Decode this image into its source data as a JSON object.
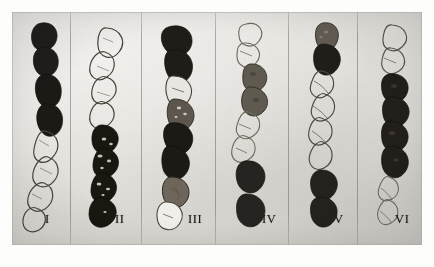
{
  "figure": {
    "kind": "microscope-photographic-plate",
    "caption_labels": [
      "I",
      "II",
      "III",
      "IV",
      "V",
      "VI"
    ],
    "background_color": "#e5e3de",
    "dark_segment_color": "#1e1c1a",
    "mid_segment_color": "#6a645c",
    "light_segment_color": "#efeeea",
    "outline_color": "#3a3732",
    "divider_color": "#76746e",
    "plate_border_color": "#ffffff"
  },
  "panels": [
    {
      "id": "panel-1",
      "label": "I",
      "label_left": 45,
      "label_top": 212,
      "divider_x": 70,
      "description": "chain with four dark stained segments at top and four pale outlined segments below",
      "segments": [
        {
          "tone": "dark"
        },
        {
          "tone": "dark"
        },
        {
          "tone": "dark"
        },
        {
          "tone": "dark"
        },
        {
          "tone": "light"
        },
        {
          "tone": "light"
        },
        {
          "tone": "light"
        },
        {
          "tone": "light"
        }
      ]
    },
    {
      "id": "panel-2",
      "label": "II",
      "label_left": 113,
      "label_top": 212,
      "divider_x": 141,
      "description": "chain with pale outlined segments at top and dark mottled segments at bottom",
      "segments": [
        {
          "tone": "light"
        },
        {
          "tone": "light"
        },
        {
          "tone": "light"
        },
        {
          "tone": "light"
        },
        {
          "tone": "dark"
        },
        {
          "tone": "mottled"
        },
        {
          "tone": "mottled"
        },
        {
          "tone": "dark"
        }
      ]
    },
    {
      "id": "panel-3",
      "label": "III",
      "label_left": 182,
      "label_top": 212,
      "divider_x": 215,
      "description": "chain alternating dark and light segments, ending in a pale segment",
      "segments": [
        {
          "tone": "dark"
        },
        {
          "tone": "dark"
        },
        {
          "tone": "light"
        },
        {
          "tone": "mottled"
        },
        {
          "tone": "dark"
        },
        {
          "tone": "dark"
        },
        {
          "tone": "mottled"
        },
        {
          "tone": "light"
        }
      ]
    },
    {
      "id": "panel-4",
      "label": "IV",
      "label_left": 258,
      "label_top": 212,
      "divider_x": 288,
      "description": "chain with pale segments at top, two mid-grey segments, pale middle, then two dark segments",
      "segments": [
        {
          "tone": "light"
        },
        {
          "tone": "light"
        },
        {
          "tone": "mid"
        },
        {
          "tone": "mid"
        },
        {
          "tone": "light"
        },
        {
          "tone": "light"
        },
        {
          "tone": "dark"
        },
        {
          "tone": "dark"
        }
      ]
    },
    {
      "id": "panel-5",
      "label": "V",
      "label_left": 328,
      "label_top": 212,
      "divider_x": 357,
      "description": "chain with mid-grey and dark segments at top, pale segments in the middle, dark segments at bottom",
      "segments": [
        {
          "tone": "mid"
        },
        {
          "tone": "dark"
        },
        {
          "tone": "light"
        },
        {
          "tone": "light"
        },
        {
          "tone": "light"
        },
        {
          "tone": "light"
        },
        {
          "tone": "dark"
        },
        {
          "tone": "dark"
        }
      ]
    },
    {
      "id": "panel-6",
      "label": "VI",
      "label_left": 397,
      "label_top": 212,
      "divider_x": null,
      "description": "chain with pale outlined segments at top, four dark segments in the middle, pale segments below",
      "segments": [
        {
          "tone": "light"
        },
        {
          "tone": "light"
        },
        {
          "tone": "dark"
        },
        {
          "tone": "dark"
        },
        {
          "tone": "dark"
        },
        {
          "tone": "dark"
        },
        {
          "tone": "light"
        },
        {
          "tone": "light"
        }
      ]
    }
  ]
}
